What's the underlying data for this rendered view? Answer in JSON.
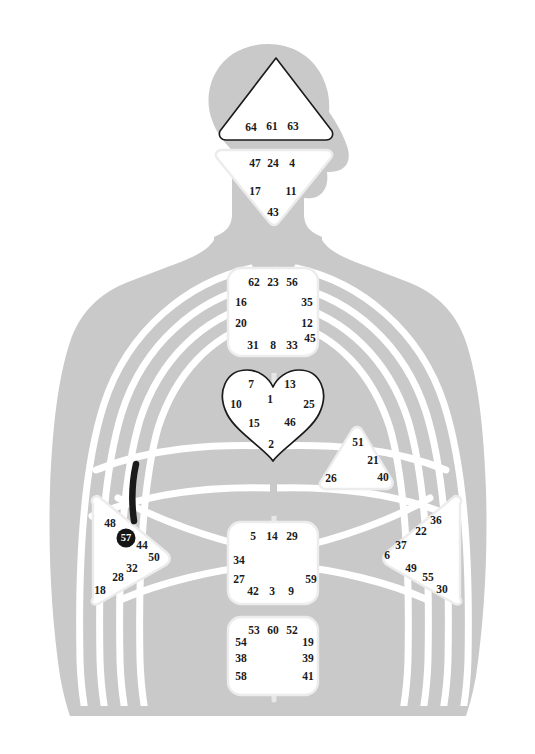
{
  "chart_data": {
    "type": "diagram",
    "subtitle": "Nine energy centers with gate numbers on a human body silhouette",
    "colors": {
      "body_silhouette": "#c9c9c9",
      "channel_line": "#ffffff",
      "center_fill": "#ffffff",
      "center_outline_light": "#e8e8e8",
      "center_outline_dark": "#1a1a1a",
      "gate_text": "#1a1a1a",
      "active_gate_fill": "#151515",
      "active_gate_text": "#ffffff",
      "active_channel": "#1a1a1a",
      "background": "#ffffff"
    },
    "active_gates": [
      "57"
    ],
    "active_channels": [
      "spleen-upper-stroke"
    ],
    "centers": [
      {
        "id": "head",
        "name": "Head Center",
        "shape": "triangle-up",
        "outline": "dark",
        "gates": [
          {
            "n": "64",
            "x": 251,
            "y": 128
          },
          {
            "n": "61",
            "x": 272,
            "y": 127
          },
          {
            "n": "63",
            "x": 293,
            "y": 127
          }
        ]
      },
      {
        "id": "ajna",
        "name": "Ajna Center",
        "shape": "triangle-down",
        "outline": "light",
        "gates": [
          {
            "n": "47",
            "x": 255,
            "y": 164
          },
          {
            "n": "24",
            "x": 273,
            "y": 164
          },
          {
            "n": "4",
            "x": 292,
            "y": 164
          },
          {
            "n": "17",
            "x": 255,
            "y": 192
          },
          {
            "n": "11",
            "x": 291,
            "y": 192
          },
          {
            "n": "43",
            "x": 273,
            "y": 213
          }
        ]
      },
      {
        "id": "throat",
        "name": "Throat Center",
        "shape": "rounded-square",
        "outline": "light",
        "gates": [
          {
            "n": "62",
            "x": 254,
            "y": 283
          },
          {
            "n": "23",
            "x": 273,
            "y": 283
          },
          {
            "n": "56",
            "x": 292,
            "y": 283
          },
          {
            "n": "16",
            "x": 241,
            "y": 303
          },
          {
            "n": "35",
            "x": 307,
            "y": 303
          },
          {
            "n": "20",
            "x": 241,
            "y": 324
          },
          {
            "n": "12",
            "x": 307,
            "y": 324
          },
          {
            "n": "45",
            "x": 310,
            "y": 339
          },
          {
            "n": "31",
            "x": 253,
            "y": 346
          },
          {
            "n": "8",
            "x": 273,
            "y": 346
          },
          {
            "n": "33",
            "x": 292,
            "y": 346
          }
        ]
      },
      {
        "id": "g-center",
        "name": "G Center / Identity",
        "shape": "heart",
        "outline": "dark",
        "gates": [
          {
            "n": "7",
            "x": 251,
            "y": 385
          },
          {
            "n": "13",
            "x": 290,
            "y": 385
          },
          {
            "n": "1",
            "x": 270,
            "y": 400
          },
          {
            "n": "10",
            "x": 236,
            "y": 405
          },
          {
            "n": "25",
            "x": 309,
            "y": 405
          },
          {
            "n": "15",
            "x": 254,
            "y": 424
          },
          {
            "n": "46",
            "x": 290,
            "y": 423
          },
          {
            "n": "2",
            "x": 271,
            "y": 445
          }
        ]
      },
      {
        "id": "heart",
        "name": "Heart / Ego Center",
        "shape": "triangle-left",
        "outline": "light",
        "gates": [
          {
            "n": "51",
            "x": 358,
            "y": 443
          },
          {
            "n": "21",
            "x": 373,
            "y": 461
          },
          {
            "n": "26",
            "x": 331,
            "y": 479
          },
          {
            "n": "40",
            "x": 383,
            "y": 478
          }
        ]
      },
      {
        "id": "spleen",
        "name": "Spleen Center",
        "shape": "triangle-right",
        "outline": "light",
        "gates": [
          {
            "n": "48",
            "x": 110,
            "y": 524
          },
          {
            "n": "57",
            "x": 126,
            "y": 538,
            "active": true
          },
          {
            "n": "44",
            "x": 142,
            "y": 546
          },
          {
            "n": "50",
            "x": 154,
            "y": 558
          },
          {
            "n": "32",
            "x": 132,
            "y": 569
          },
          {
            "n": "28",
            "x": 118,
            "y": 578
          },
          {
            "n": "18",
            "x": 100,
            "y": 591
          }
        ]
      },
      {
        "id": "sacral",
        "name": "Sacral Center",
        "shape": "rounded-square",
        "outline": "light",
        "gates": [
          {
            "n": "5",
            "x": 253,
            "y": 537
          },
          {
            "n": "14",
            "x": 272,
            "y": 537
          },
          {
            "n": "29",
            "x": 292,
            "y": 537
          },
          {
            "n": "34",
            "x": 239,
            "y": 561
          },
          {
            "n": "27",
            "x": 239,
            "y": 580
          },
          {
            "n": "59",
            "x": 311,
            "y": 580
          },
          {
            "n": "42",
            "x": 253,
            "y": 592
          },
          {
            "n": "3",
            "x": 272,
            "y": 592
          },
          {
            "n": "9",
            "x": 291,
            "y": 592
          }
        ]
      },
      {
        "id": "solar-plexus",
        "name": "Solar Plexus Center",
        "shape": "triangle-left",
        "outline": "light",
        "gates": [
          {
            "n": "36",
            "x": 436,
            "y": 521
          },
          {
            "n": "22",
            "x": 421,
            "y": 532
          },
          {
            "n": "37",
            "x": 401,
            "y": 546
          },
          {
            "n": "6",
            "x": 387,
            "y": 556
          },
          {
            "n": "49",
            "x": 411,
            "y": 569
          },
          {
            "n": "55",
            "x": 428,
            "y": 578
          },
          {
            "n": "30",
            "x": 442,
            "y": 590
          }
        ]
      },
      {
        "id": "root",
        "name": "Root Center",
        "shape": "rounded-square",
        "outline": "light",
        "gates": [
          {
            "n": "53",
            "x": 254,
            "y": 631
          },
          {
            "n": "60",
            "x": 273,
            "y": 631
          },
          {
            "n": "52",
            "x": 292,
            "y": 631
          },
          {
            "n": "54",
            "x": 241,
            "y": 643
          },
          {
            "n": "19",
            "x": 308,
            "y": 643
          },
          {
            "n": "38",
            "x": 241,
            "y": 659
          },
          {
            "n": "39",
            "x": 308,
            "y": 659
          },
          {
            "n": "58",
            "x": 241,
            "y": 677
          },
          {
            "n": "41",
            "x": 308,
            "y": 677
          }
        ]
      }
    ]
  }
}
